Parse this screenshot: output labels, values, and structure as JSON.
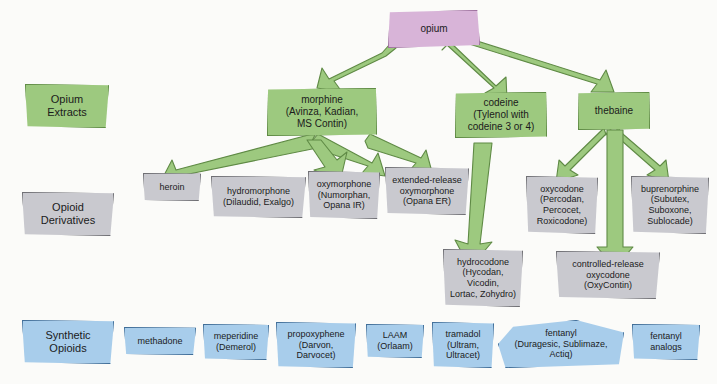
{
  "diagram": {
    "colors": {
      "opium_fill": "#d8b4d8",
      "extract_fill": "#9dc97f",
      "derivative_fill": "#c9c9cf",
      "synthetic_fill": "#a8cdeb",
      "arrow_fill": "#9dc97f",
      "arrow_stroke": "#5f8a45",
      "background": "#fbfbf9"
    }
  },
  "categories": [
    {
      "id": "opium-extracts",
      "label": "Opium\nExtracts"
    },
    {
      "id": "opioid-derivatives",
      "label": "Opioid\nDerivatives"
    },
    {
      "id": "synthetic-opioids",
      "label": "Synthetic\nOpioids"
    }
  ],
  "category_labels": {
    "opium_extracts_line1": "Opium",
    "opium_extracts_line2": "Extracts",
    "opioid_derivatives_line1": "Opioid",
    "opioid_derivatives_line2": "Derivatives",
    "synthetic_opioids_line1": "Synthetic",
    "synthetic_opioids_line2": "Opioids"
  },
  "root": {
    "name": "opium"
  },
  "extracts": [
    {
      "id": "morphine",
      "name": "morphine",
      "brands": "(Avinza, Kadian,\nMS Contin)"
    },
    {
      "id": "codeine",
      "name": "codeine",
      "brands": "(Tylenol with\ncodeine 3 or 4)"
    },
    {
      "id": "thebaine",
      "name": "thebaine",
      "brands": ""
    }
  ],
  "derivatives": [
    {
      "id": "heroin",
      "name": "heroin",
      "brands": ""
    },
    {
      "id": "hydromorphone",
      "name": "hydromorphone",
      "brands": "(Dilaudid, Exalgo)"
    },
    {
      "id": "oxymorphone",
      "name": "oxymorphone",
      "brands": "(Numorphan,\nOpana IR)"
    },
    {
      "id": "er-oxymorphone",
      "name": "extended-release\noxymorphone",
      "brands": "(Opana ER)"
    },
    {
      "id": "oxycodone",
      "name": "oxycodone",
      "brands": "(Percodan,\nPercocet,\nRoxicodone)"
    },
    {
      "id": "buprenorphine",
      "name": "buprenorphine",
      "brands": "(Subutex,\nSuboxone,\nSublocade)"
    },
    {
      "id": "hydrocodone",
      "name": "hydrocodone",
      "brands": "(Hycodan,\nVicodin,\nLortac, Zohydro)"
    },
    {
      "id": "cr-oxycodone",
      "name": "controlled-release\noxycodone",
      "brands": "(OxyContin)"
    }
  ],
  "synthetics": [
    {
      "id": "methadone",
      "name": "methadone",
      "brands": ""
    },
    {
      "id": "meperidine",
      "name": "meperidine",
      "brands": "(Demerol)"
    },
    {
      "id": "propoxyphene",
      "name": "propoxyphene",
      "brands": "(Darvon,\nDarvocet)"
    },
    {
      "id": "laam",
      "name": "LAAM",
      "brands": "(Orlaam)"
    },
    {
      "id": "tramadol",
      "name": "tramadol",
      "brands": "(Ultram,\nUltracet)"
    },
    {
      "id": "fentanyl",
      "name": "fentanyl",
      "brands": "(Duragesic, Sublimaze,\nActiq)"
    },
    {
      "id": "fentanyl-analogs",
      "name": "fentanyl\nanalogs",
      "brands": ""
    }
  ],
  "edges": [
    {
      "from": "opium",
      "to": "morphine"
    },
    {
      "from": "opium",
      "to": "codeine"
    },
    {
      "from": "opium",
      "to": "thebaine"
    },
    {
      "from": "morphine",
      "to": "heroin"
    },
    {
      "from": "morphine",
      "to": "hydromorphone"
    },
    {
      "from": "morphine",
      "to": "oxymorphone"
    },
    {
      "from": "morphine",
      "to": "er-oxymorphone"
    },
    {
      "from": "codeine",
      "to": "hydrocodone"
    },
    {
      "from": "thebaine",
      "to": "oxycodone"
    },
    {
      "from": "thebaine",
      "to": "buprenorphine"
    },
    {
      "from": "thebaine",
      "to": "cr-oxycodone"
    }
  ]
}
